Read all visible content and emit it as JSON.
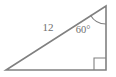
{
  "figure": {
    "type": "right-triangle-diagram",
    "background_color": "#ffffff",
    "stroke_color": "#808080",
    "label_color": "#6f6f6f",
    "hypotenuse_label": "12",
    "angle_label": "60°",
    "right_angle_marker": "right-angle-square",
    "vertices": {
      "bottom_left": [
        6,
        70
      ],
      "bottom_right": [
        106,
        70
      ],
      "top_right": [
        106,
        6
      ]
    },
    "angle_arc": {
      "at_vertex": "top_right",
      "radius": 18
    }
  }
}
